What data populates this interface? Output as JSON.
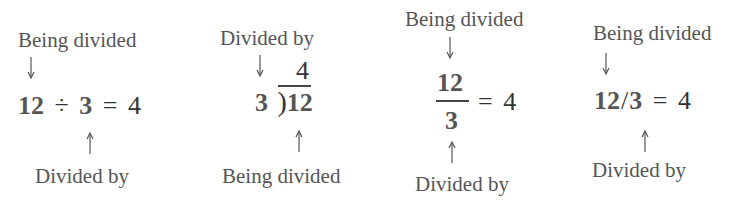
{
  "panels": [
    {
      "notation": "division-sign",
      "top_label": "Being divided",
      "dividend": "12",
      "operator": "÷",
      "divisor": "3",
      "equals": "=",
      "quotient": "4",
      "bottom_label": "Divided by"
    },
    {
      "notation": "long-division",
      "top_label": "Divided by",
      "quotient": "4",
      "divisor": "3",
      "bracket": ")",
      "dividend": "12",
      "bottom_label": "Being divided"
    },
    {
      "notation": "fraction",
      "top_label": "Being divided",
      "dividend": "12",
      "divisor": "3",
      "equals": "=",
      "quotient": "4",
      "bottom_label": "Divided by"
    },
    {
      "notation": "slash",
      "top_label": "Being divided",
      "dividend": "12",
      "operator": "/",
      "divisor": "3",
      "equals": "=",
      "quotient": "4",
      "bottom_label": "Divided by"
    }
  ]
}
